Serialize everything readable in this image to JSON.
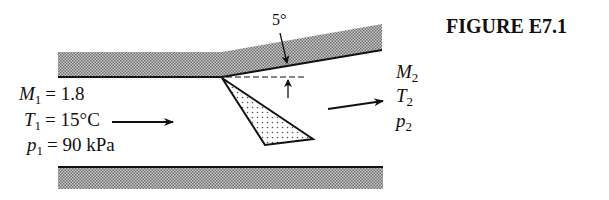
{
  "figure": {
    "title": "FIGURE E7.1",
    "angle_label": "5°",
    "upstream": {
      "mach": {
        "symbol": "M",
        "sub": "1",
        "value": "= 1.8"
      },
      "temperature": {
        "symbol": "T",
        "sub": "1",
        "value": "= 15°C"
      },
      "pressure": {
        "symbol": "p",
        "sub": "1",
        "value": "= 90 kPa"
      }
    },
    "downstream": {
      "mach": {
        "symbol": "M",
        "sub": "2"
      },
      "temperature": {
        "symbol": "T",
        "sub": "2"
      },
      "pressure": {
        "symbol": "p",
        "sub": "2"
      }
    },
    "colors": {
      "ink": "#111111",
      "wall_hatch": "#8a8a8a",
      "shock_dots": "#555555",
      "background": "#ffffff"
    }
  }
}
